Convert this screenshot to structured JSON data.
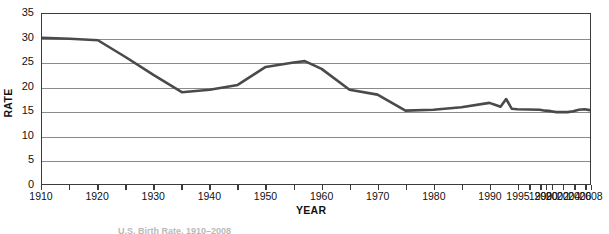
{
  "figure": {
    "background_color": "#ffffff",
    "frame_color": "#3b3b3b",
    "gridline_color": "#8a8a8a",
    "series_color": "#4a4a4a"
  },
  "caption": {
    "text": "U.S. Birth Rate, 1910–2008"
  },
  "chart_data": {
    "type": "line",
    "title": "",
    "subtitle": "",
    "xlabel": "YEAR",
    "ylabel": "RATE",
    "xlim": [
      1910,
      2008
    ],
    "ylim": [
      0,
      35
    ],
    "ytick_labels": [
      "0",
      "5",
      "10",
      "15",
      "20",
      "25",
      "30",
      "35"
    ],
    "yticks": [
      0,
      5,
      10,
      15,
      20,
      25,
      30,
      35
    ],
    "xtick_labels": [
      "1910",
      "1920",
      "1930",
      "1940",
      "1950",
      "1960",
      "1970",
      "1980",
      "1990",
      "1995",
      "1999",
      "2000",
      "2002",
      "2004",
      "2006",
      "2008"
    ],
    "xticks": [
      1910,
      1920,
      1930,
      1940,
      1950,
      1960,
      1970,
      1980,
      1990,
      1995,
      1999,
      2000,
      2002,
      2004,
      2006,
      2008
    ],
    "grid": "horizontal",
    "legend": "none",
    "annotations": [],
    "series": [
      {
        "name": "RATE",
        "color": "#4a4a4a",
        "x": [
          1910,
          1915,
          1920,
          1925,
          1930,
          1935,
          1940,
          1945,
          1950,
          1955,
          1957,
          1960,
          1965,
          1970,
          1975,
          1980,
          1985,
          1990,
          1991,
          1992,
          1993,
          1994,
          1995,
          1999,
          2000,
          2001,
          2002,
          2003,
          2004,
          2005,
          2006,
          2007,
          2008
        ],
        "y": [
          30.1,
          29.9,
          29.6,
          26.1,
          22.4,
          18.9,
          19.4,
          20.4,
          24.1,
          25.0,
          25.3,
          23.7,
          19.4,
          18.4,
          15.1,
          15.3,
          15.8,
          16.7,
          16.3,
          15.9,
          17.5,
          15.5,
          15.4,
          15.3,
          15.1,
          15.0,
          14.8,
          14.8,
          14.8,
          15.0,
          15.3,
          15.4,
          15.2
        ]
      }
    ]
  }
}
